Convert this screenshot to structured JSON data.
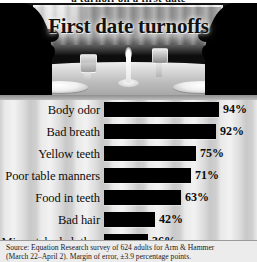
{
  "clipped_header": "a turnoff on a first date",
  "graphic": {
    "title": "First date turnoffs",
    "scene": {
      "left_silhouette": "man-profile-silhouette",
      "right_silhouette": "woman-profile-silhouette",
      "props": [
        "dinner-plate-left",
        "dinner-plate-right",
        "candle",
        "water-glass",
        "wine-glass",
        "curtained-window"
      ]
    }
  },
  "source": {
    "line1": "Source: Equation Research survey of 624 adults for Arm & Hammer",
    "line2": "(March 22–April 2). Margin of error, ±3.9 percentage points."
  },
  "chart_data": {
    "type": "bar",
    "orientation": "horizontal",
    "title": "First date turnoffs",
    "xlabel": "",
    "ylabel": "",
    "xlim": [
      0,
      100
    ],
    "grid": false,
    "legend": null,
    "value_suffix": "%",
    "categories": [
      "Body odor",
      "Bad breath",
      "Yellow teeth",
      "Poor table manners",
      "Food in teeth",
      "Bad hair",
      "Mismatched clothes"
    ],
    "values": [
      94,
      92,
      75,
      71,
      63,
      42,
      36
    ],
    "labels": [
      "94%",
      "92%",
      "75%",
      "71%",
      "63%",
      "42%",
      "36%"
    ],
    "bar_color": "#000000",
    "background_color": "#d8d8d8"
  }
}
